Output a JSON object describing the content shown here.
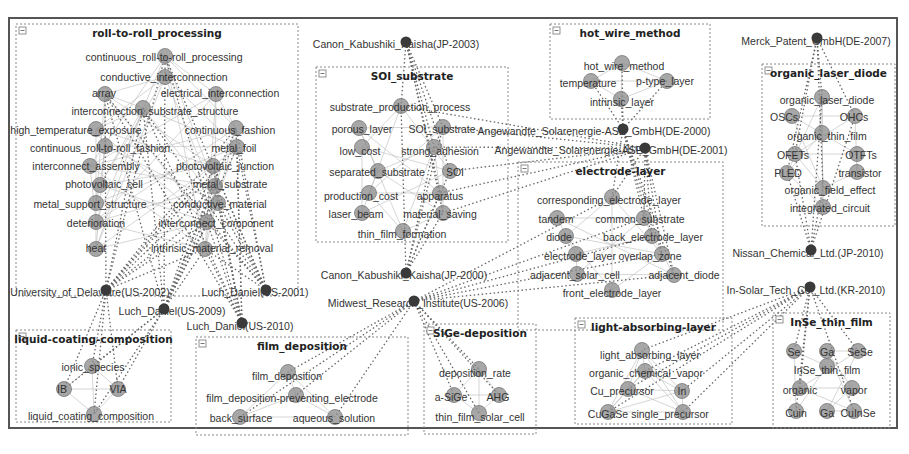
{
  "figure": {
    "type": "patent-keyword-assignee network",
    "colors": {
      "frame": "#555555",
      "cluster_border": "#888888",
      "keyword_node": "#8a8a8a",
      "assignee_node": "#3a3a3a",
      "edge": "#666666",
      "text": "#333333"
    }
  },
  "clusters": [
    {
      "id": "c1",
      "title": "roll-to-roll_processing",
      "box": [
        16,
        24,
        282,
        272
      ],
      "nodes": [
        {
          "label": "continuous_roll-to-roll_processing",
          "x": 164,
          "y": 57,
          "nx": 165,
          "ny": 56
        },
        {
          "label": "conductive_interconnection",
          "x": 164,
          "y": 77,
          "nx": 165,
          "ny": 77
        },
        {
          "label": "array",
          "x": 104,
          "y": 93,
          "nx": 105,
          "ny": 94
        },
        {
          "label": "electrical_interconnection",
          "x": 220,
          "y": 93,
          "nx": 216,
          "ny": 94
        },
        {
          "label": "interconnection_substrate_structure",
          "x": 155,
          "y": 111,
          "nx": 143,
          "ny": 108
        },
        {
          "label": "high_temperature_exposure",
          "x": 76,
          "y": 130,
          "nx": 96,
          "ny": 129
        },
        {
          "label": "continuous_fashion",
          "x": 230,
          "y": 130,
          "nx": 236,
          "ny": 128
        },
        {
          "label": "continuous_roll-to-roll_fashion",
          "x": 100,
          "y": 148,
          "nx": 105,
          "ny": 146
        },
        {
          "label": "metal_foil",
          "x": 234,
          "y": 148,
          "nx": 237,
          "ny": 147
        },
        {
          "label": "interconnect_assembly",
          "x": 86,
          "y": 166,
          "nx": 90,
          "ny": 166
        },
        {
          "label": "photovoltaic_junction",
          "x": 225,
          "y": 166,
          "nx": 213,
          "ny": 166
        },
        {
          "label": "photovoltaic_cell",
          "x": 104,
          "y": 184,
          "nx": 100,
          "ny": 185
        },
        {
          "label": "metal_substrate",
          "x": 230,
          "y": 184,
          "nx": 215,
          "ny": 186
        },
        {
          "label": "metal_support_structure",
          "x": 90,
          "y": 204,
          "nx": 96,
          "ny": 203
        },
        {
          "label": "conductive_material",
          "x": 220,
          "y": 204,
          "nx": 218,
          "ny": 203
        },
        {
          "label": "deterioration",
          "x": 96,
          "y": 223,
          "nx": 96,
          "ny": 222
        },
        {
          "label": "interconnect_component",
          "x": 216,
          "y": 223,
          "nx": 207,
          "ny": 222
        },
        {
          "label": "heat",
          "x": 96,
          "y": 248,
          "nx": 96,
          "ny": 249
        },
        {
          "label": "intrinsic_material_removal",
          "x": 212,
          "y": 248,
          "nx": 205,
          "ny": 249
        }
      ]
    },
    {
      "id": "c2",
      "title": "SOI_substrate",
      "box": [
        316,
        67,
        192,
        175
      ],
      "nodes": [
        {
          "label": "substrate_production_process",
          "x": 400,
          "y": 107,
          "nx": 401,
          "ny": 106
        },
        {
          "label": "porous_layer",
          "x": 362,
          "y": 129,
          "nx": 359,
          "ny": 128
        },
        {
          "label": "SOI_substrate",
          "x": 442,
          "y": 129,
          "nx": 443,
          "ny": 127
        },
        {
          "label": "low_cost",
          "x": 360,
          "y": 151,
          "nx": 362,
          "ny": 147
        },
        {
          "label": "strong_adhesion",
          "x": 440,
          "y": 151,
          "nx": 434,
          "ny": 147
        },
        {
          "label": "separated_substrate",
          "x": 377,
          "y": 172,
          "nx": 378,
          "ny": 171
        },
        {
          "label": "SOI",
          "x": 455,
          "y": 172,
          "nx": 450,
          "ny": 171
        },
        {
          "label": "production_cost",
          "x": 361,
          "y": 196,
          "nx": 369,
          "ny": 193
        },
        {
          "label": "apparatus",
          "x": 440,
          "y": 196,
          "nx": 440,
          "ny": 193
        },
        {
          "label": "laser_beam",
          "x": 356,
          "y": 214,
          "nx": 362,
          "ny": 213
        },
        {
          "label": "material_saving",
          "x": 440,
          "y": 214,
          "nx": 443,
          "ny": 213
        },
        {
          "label": "thin_film_formation",
          "x": 402,
          "y": 234,
          "nx": 403,
          "ny": 231
        }
      ]
    },
    {
      "id": "c3",
      "title": "hot_wire_method",
      "box": [
        550,
        24,
        160,
        95
      ],
      "nodes": [
        {
          "label": "hot_wire_method",
          "x": 624,
          "y": 66,
          "nx": 622,
          "ny": 63
        },
        {
          "label": "temperature",
          "x": 588,
          "y": 83,
          "nx": 591,
          "ny": 81
        },
        {
          "label": "p-type_layer",
          "x": 665,
          "y": 81,
          "nx": 667,
          "ny": 81
        },
        {
          "label": "intrinsic_layer",
          "x": 622,
          "y": 102,
          "nx": 621,
          "ny": 99
        }
      ]
    },
    {
      "id": "c4",
      "title": "electrode-layer",
      "box": [
        518,
        162,
        205,
        168
      ],
      "nodes": [
        {
          "label": "corresponding_electrode_layer",
          "x": 609,
          "y": 200,
          "nx": 612,
          "ny": 197
        },
        {
          "label": "tandem",
          "x": 556,
          "y": 219,
          "nx": 557,
          "ny": 218
        },
        {
          "label": "common_substrate",
          "x": 640,
          "y": 219,
          "nx": 644,
          "ny": 218
        },
        {
          "label": "diode",
          "x": 559,
          "y": 237,
          "nx": 566,
          "ny": 236
        },
        {
          "label": "back_electrode_layer",
          "x": 653,
          "y": 237,
          "nx": 652,
          "ny": 236
        },
        {
          "label": "electrode_layer",
          "x": 580,
          "y": 256,
          "nx": 576,
          "ny": 254
        },
        {
          "label": "overlap_zone",
          "x": 650,
          "y": 256,
          "nx": 662,
          "ny": 254
        },
        {
          "label": "adjacent_solar_cell",
          "x": 575,
          "y": 275,
          "nx": 577,
          "ny": 274
        },
        {
          "label": "adjacent_diode",
          "x": 684,
          "y": 275,
          "nx": 674,
          "ny": 275
        },
        {
          "label": "front_electrode_layer",
          "x": 612,
          "y": 293,
          "nx": 612,
          "ny": 290
        }
      ]
    },
    {
      "id": "c5",
      "title": "organic_laser_diode",
      "box": [
        762,
        64,
        133,
        162
      ],
      "nodes": [
        {
          "label": "organic_laser_diode",
          "x": 827,
          "y": 100,
          "nx": 822,
          "ny": 97
        },
        {
          "label": "OSCs",
          "x": 784,
          "y": 117,
          "nx": 792,
          "ny": 116
        },
        {
          "label": "OHCs",
          "x": 854,
          "y": 117,
          "nx": 855,
          "ny": 116
        },
        {
          "label": "organic_thin_film",
          "x": 827,
          "y": 136,
          "nx": 822,
          "ny": 133
        },
        {
          "label": "OFETs",
          "x": 793,
          "y": 155,
          "nx": 795,
          "ny": 154
        },
        {
          "label": "OTFTs",
          "x": 861,
          "y": 155,
          "nx": 857,
          "ny": 154
        },
        {
          "label": "PLED",
          "x": 788,
          "y": 173,
          "nx": 787,
          "ny": 173
        },
        {
          "label": "transistor",
          "x": 860,
          "y": 173,
          "nx": 857,
          "ny": 172
        },
        {
          "label": "organic_field_effect",
          "x": 830,
          "y": 190,
          "nx": 823,
          "ny": 188
        },
        {
          "label": "integrated_circuit",
          "x": 830,
          "y": 208,
          "nx": 823,
          "ny": 207
        }
      ]
    },
    {
      "id": "c6",
      "title": "liquid-coating-composition",
      "box": [
        16,
        330,
        155,
        92
      ],
      "nodes": [
        {
          "label": "ionic_species",
          "x": 93,
          "y": 367,
          "nx": 92,
          "ny": 366
        },
        {
          "label": "IB",
          "x": 62,
          "y": 389,
          "nx": 64,
          "ny": 389
        },
        {
          "label": "VIA",
          "x": 118,
          "y": 389,
          "nx": 118,
          "ny": 389
        },
        {
          "label": "liquid_coating_composition",
          "x": 91,
          "y": 416,
          "nx": 94,
          "ny": 414
        }
      ]
    },
    {
      "id": "c7",
      "title": "film_deposition",
      "box": [
        196,
        337,
        212,
        98
      ],
      "nodes": [
        {
          "label": "film_deposition",
          "x": 287,
          "y": 376,
          "nx": 288,
          "ny": 372
        },
        {
          "label": "film_deposition-preventing_electrode",
          "x": 292,
          "y": 398,
          "nx": 296,
          "ny": 395
        },
        {
          "label": "back_surface",
          "x": 241,
          "y": 418,
          "nx": 240,
          "ny": 417
        },
        {
          "label": "aqueous_solution",
          "x": 334,
          "y": 418,
          "nx": 335,
          "ny": 417
        }
      ]
    },
    {
      "id": "c8",
      "title": "SiGe-deposition",
      "box": [
        424,
        324,
        112,
        110
      ],
      "nodes": [
        {
          "label": "deposition_rate",
          "x": 475,
          "y": 373,
          "nx": 479,
          "ny": 369
        },
        {
          "label": "a-SiGe",
          "x": 451,
          "y": 397,
          "nx": 454,
          "ny": 395
        },
        {
          "label": "AHG",
          "x": 498,
          "y": 397,
          "nx": 499,
          "ny": 395
        },
        {
          "label": "thin_film_solar_cell",
          "x": 480,
          "y": 417,
          "nx": 479,
          "ny": 413
        }
      ]
    },
    {
      "id": "c9",
      "title": "light-absorbing-layer",
      "box": [
        575,
        318,
        157,
        106
      ],
      "nodes": [
        {
          "label": "light_absorbing_layer",
          "x": 650,
          "y": 355,
          "nx": 642,
          "ny": 350
        },
        {
          "label": "organic_chemical_vapor",
          "x": 646,
          "y": 373,
          "nx": 645,
          "ny": 371
        },
        {
          "label": "Cu_precursor",
          "x": 622,
          "y": 391,
          "nx": 628,
          "ny": 389
        },
        {
          "label": "In",
          "x": 682,
          "y": 391,
          "nx": 682,
          "ny": 391
        },
        {
          "label": "CuGaSe",
          "x": 608,
          "y": 414,
          "nx": 608,
          "ny": 412
        },
        {
          "label": "single_precursor",
          "x": 670,
          "y": 414,
          "nx": 683,
          "ny": 412
        }
      ]
    },
    {
      "id": "c10",
      "title": "InSe_thin_film",
      "box": [
        773,
        313,
        117,
        115
      ],
      "nodes": [
        {
          "label": "Se",
          "x": 794,
          "y": 352,
          "nx": 794,
          "ny": 351
        },
        {
          "label": "Ga",
          "x": 827,
          "y": 352,
          "nx": 827,
          "ny": 351
        },
        {
          "label": "SeSe",
          "x": 860,
          "y": 352,
          "nx": 858,
          "ny": 351
        },
        {
          "label": "InSe_thin_film",
          "x": 827,
          "y": 370,
          "nx": 827,
          "ny": 366
        },
        {
          "label": "organic",
          "x": 800,
          "y": 390,
          "nx": 800,
          "ny": 388
        },
        {
          "label": "vapor",
          "x": 854,
          "y": 390,
          "nx": 852,
          "ny": 388
        },
        {
          "label": "Cuin",
          "x": 796,
          "y": 413,
          "nx": 796,
          "ny": 411
        },
        {
          "label": "Ga",
          "x": 827,
          "y": 413,
          "nx": 827,
          "ny": 411
        },
        {
          "label": "CuInSe",
          "x": 858,
          "y": 413,
          "nx": 854,
          "ny": 411
        }
      ]
    }
  ],
  "assignees": [
    {
      "id": "a1",
      "label": "Canon_Kabushiki_Kaisha(JP-2003)",
      "x": 396,
      "y": 44,
      "nx": 406,
      "ny": 42,
      "targets": [
        "c2"
      ]
    },
    {
      "id": "a2",
      "label": "Canon_Kabushiki_Kaisha(JP-2000)",
      "x": 404,
      "y": 275,
      "nx": 406,
      "ny": 273,
      "targets": [
        "c2"
      ]
    },
    {
      "id": "a3",
      "label": "Midwest_Research_Institute(US-2006)",
      "x": 418,
      "y": 303,
      "nx": 414,
      "ny": 301,
      "targets": [
        "c7",
        "c8",
        "c4"
      ]
    },
    {
      "id": "a4",
      "label": "University_of_Delaware(US-2002)",
      "x": 90,
      "y": 292,
      "nx": 106,
      "ny": 290,
      "targets": [
        "c1",
        "c6"
      ]
    },
    {
      "id": "a5",
      "label": "Luch_Daniel(US-2001)",
      "x": 255,
      "y": 292,
      "nx": 266,
      "ny": 290,
      "targets": [
        "c1"
      ]
    },
    {
      "id": "a6",
      "label": "Luch_Daniel(US-2009)",
      "x": 172,
      "y": 311,
      "nx": 164,
      "ny": 309,
      "targets": [
        "c1",
        "c6"
      ]
    },
    {
      "id": "a7",
      "label": "Luch_Daniel(US-2010)",
      "x": 240,
      "y": 326,
      "nx": 242,
      "ny": 323,
      "targets": [
        "c1"
      ]
    },
    {
      "id": "a8",
      "label": "Angewandte_Solarenergie-ASE_GmbH(DE-2000)",
      "x": 594,
      "y": 131,
      "nx": 623,
      "ny": 129,
      "targets": [
        "c3",
        "c4"
      ]
    },
    {
      "id": "a9",
      "label": "Angewandte_Solarenergie-ASE_GmbH(DE-2001)",
      "x": 611,
      "y": 150,
      "nx": 645,
      "ny": 148,
      "targets": [
        "c4",
        "c2"
      ]
    },
    {
      "id": "a10",
      "label": "Merck_Patent_GmbH(DE-2007)",
      "x": 816,
      "y": 41,
      "nx": 817,
      "ny": 38,
      "targets": [
        "c5"
      ]
    },
    {
      "id": "a11",
      "label": "Nissan_Chemical_Ltd.(JP-2010)",
      "x": 808,
      "y": 253,
      "nx": 811,
      "ny": 250,
      "targets": [
        "c5"
      ]
    },
    {
      "id": "a12",
      "label": "In-Solar_Tech_Co._Ltd.(KR-2010)",
      "x": 806,
      "y": 290,
      "nx": 810,
      "ny": 287,
      "targets": [
        "c10",
        "c9"
      ]
    }
  ]
}
